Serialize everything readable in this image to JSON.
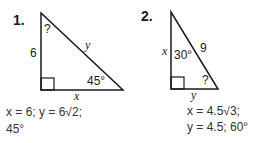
{
  "problems": [
    {
      "number": "1.",
      "side_left": "6",
      "hyp": "y",
      "base": "x",
      "top_angle": "?",
      "bottom_angle": "45°",
      "answer_line1": "x = 6; y = 6√2;",
      "answer_line2": "45°"
    },
    {
      "number": "2.",
      "side_left": "x",
      "hyp": "9",
      "base": "y",
      "top_angle": "30°",
      "bottom_angle": "?",
      "answer_line1": "x = 4.5√3;",
      "answer_line2": "y = 4.5; 60°"
    }
  ],
  "colors": {
    "ink": "#1a1a1a",
    "answer": "#333333"
  }
}
